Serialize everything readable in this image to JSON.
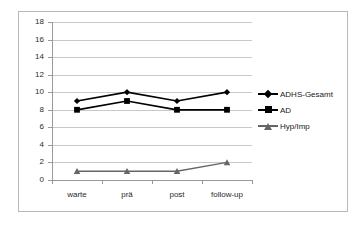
{
  "chart_data": {
    "type": "line",
    "title": "",
    "xlabel": "",
    "ylabel": "",
    "categories": [
      "warte",
      "prä",
      "post",
      "follow-up"
    ],
    "ylim": [
      0,
      18
    ],
    "ytick_step": 2,
    "yticks": [
      18,
      16,
      14,
      12,
      10,
      8,
      6,
      4,
      2,
      0
    ],
    "grid": "horizontal",
    "legend_position": "right",
    "series": [
      {
        "name": "ADHS-Gesamt",
        "values": [
          9,
          10,
          9,
          10
        ],
        "marker": "diamond",
        "color": "#000000"
      },
      {
        "name": "AD",
        "values": [
          8,
          9,
          8,
          8
        ],
        "marker": "square",
        "color": "#000000"
      },
      {
        "name": "Hyp/Imp",
        "values": [
          1,
          1,
          1,
          2
        ],
        "marker": "triangle",
        "color": "#666666"
      }
    ]
  },
  "axis": {
    "y_labels": [
      "18",
      "16",
      "14",
      "12",
      "10",
      "8",
      "6",
      "4",
      "2",
      "0"
    ],
    "x_labels": [
      "warte",
      "prä",
      "post",
      "follow-up"
    ]
  },
  "legend": {
    "items": [
      {
        "label": "ADHS-Gesamt"
      },
      {
        "label": "AD"
      },
      {
        "label": "Hyp/Imp"
      }
    ]
  },
  "colors": {
    "series_primary": "#000000",
    "series_secondary": "#666666",
    "gridline": "#c8c8c8",
    "axis": "#9a9a9a",
    "frame": "#b9b9b9",
    "background": "#ffffff",
    "text": "#2b2b2b"
  }
}
